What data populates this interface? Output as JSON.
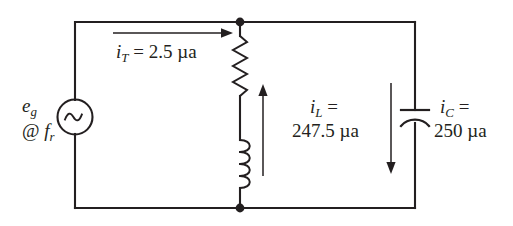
{
  "diagram": {
    "background_color": "#ffffff",
    "line_color": "#231f20",
    "source": {
      "type": "ac-voltage-source",
      "symbol": "sine-wave",
      "label_line1": "e",
      "label_line1_sub": "g",
      "label_line2_prefix": "@ ",
      "label_line2": "f",
      "label_line2_sub": "r"
    },
    "components": [
      {
        "name": "resistor",
        "symbol": "zigzag",
        "branch": "middle"
      },
      {
        "name": "inductor",
        "symbol": "coil",
        "branch": "middle"
      },
      {
        "name": "capacitor",
        "symbol": "curved-plate",
        "branch": "right"
      }
    ],
    "currents": [
      {
        "id": "total",
        "symbol": "i",
        "subscript": "T",
        "equals": " = ",
        "value": "2.5",
        "unit": "µa",
        "text": "i_T = 2.5 µa",
        "arrow_direction": "right"
      },
      {
        "id": "inductor",
        "symbol": "i",
        "subscript": "L",
        "equals": " =",
        "value": "247.5",
        "unit": "µa",
        "text": "i_L = 247.5 µa",
        "arrow_direction": "up"
      },
      {
        "id": "capacitor",
        "symbol": "i",
        "subscript": "C",
        "equals": " =",
        "value": "250",
        "unit": "µa",
        "text": "i_C = 250 µa",
        "arrow_direction": "down"
      }
    ],
    "nodes": [
      {
        "name": "top-node",
        "x": 240,
        "y": 22
      },
      {
        "name": "bottom-node",
        "x": 240,
        "y": 208
      }
    ]
  }
}
